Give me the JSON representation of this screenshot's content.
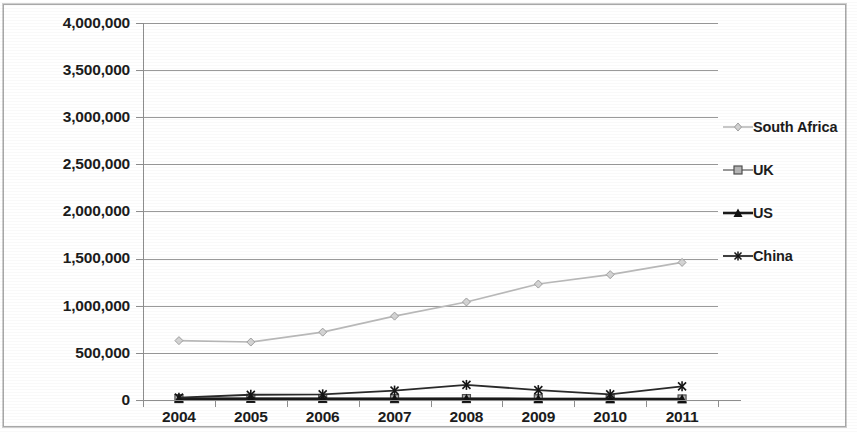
{
  "chart_data": {
    "type": "line",
    "title": "",
    "subtitle": "",
    "xlabel": "",
    "ylabel": "",
    "categories": [
      "2004",
      "2005",
      "2006",
      "2007",
      "2008",
      "2009",
      "2010",
      "2011"
    ],
    "x_tick_labels": [
      "2004",
      "2005",
      "2006",
      "2007",
      "2008",
      "2009",
      "2010",
      "2011"
    ],
    "y_tick_labels": [
      "4,000,000",
      "3,500,000",
      "3,000,000",
      "2,500,000",
      "2,000,000",
      "1,500,000",
      "1,000,000",
      "500,000",
      "0"
    ],
    "y_tick_values": [
      4000000,
      3500000,
      3000000,
      2500000,
      2000000,
      1500000,
      1000000,
      500000,
      0
    ],
    "ylim": [
      0,
      4000000
    ],
    "grid": true,
    "grid_axis": "y",
    "legend_position": "right",
    "series": [
      {
        "name": "South Africa",
        "color": "#b9b9b9",
        "marker": "diamond",
        "values": [
          630000,
          615000,
          720000,
          890000,
          1040000,
          1230000,
          1330000,
          1460000
        ]
      },
      {
        "name": "UK",
        "color": "#9a9a9a",
        "marker": "square",
        "values": [
          15000,
          18000,
          16000,
          14000,
          15000,
          13000,
          12000,
          11000
        ]
      },
      {
        "name": "US",
        "color": "#1a1a1a",
        "marker": "triangle",
        "values": [
          12000,
          14000,
          13000,
          12000,
          13000,
          11000,
          10000,
          10000
        ]
      },
      {
        "name": "China",
        "color": "#2a2a2a",
        "marker": "star",
        "values": [
          25000,
          55000,
          60000,
          100000,
          160000,
          105000,
          60000,
          145000
        ]
      }
    ]
  },
  "legend": {
    "items": [
      {
        "label": "South Africa"
      },
      {
        "label": "UK"
      },
      {
        "label": "US"
      },
      {
        "label": "China"
      }
    ]
  },
  "colors": {
    "south_africa": "#b9b9b9",
    "uk": "#9a9a9a",
    "us": "#1a1a1a",
    "china": "#2a2a2a",
    "grid": "#9a9a9a",
    "axis": "#8e8e8e",
    "text": "#1c1c1c",
    "background": "#ffffff"
  }
}
